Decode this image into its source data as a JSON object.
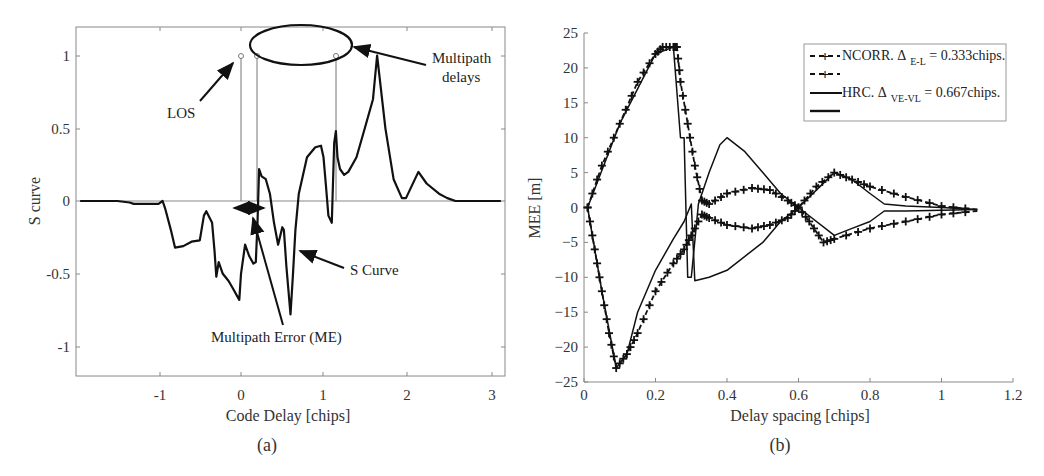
{
  "figure": {
    "panels": [
      {
        "id": "a",
        "caption": "(a)"
      },
      {
        "id": "b",
        "caption": "(b)"
      }
    ]
  },
  "chart_data": [
    {
      "type": "line",
      "panel": "(a)",
      "title": "",
      "xlabel": "Code Delay [chips]",
      "ylabel": "S curve",
      "xlim": [
        -1.95,
        3.15
      ],
      "ylim": [
        -1.2,
        1.2
      ],
      "xticks": [
        "-1",
        "0",
        "1",
        "2",
        "3"
      ],
      "yticks": [
        "1",
        "0.5",
        "0",
        "-0.5",
        "-1"
      ],
      "grid": false,
      "annotations": [
        "LOS",
        "Multipath delays",
        "S Curve",
        "Multipath Error (ME)"
      ],
      "series": [
        {
          "name": "S Curve",
          "x": [
            -1.95,
            -1.5,
            -1.35,
            -1.3,
            -1.0,
            -0.95,
            -0.92,
            -0.85,
            -0.8,
            -0.7,
            -0.6,
            -0.5,
            -0.45,
            -0.42,
            -0.35,
            -0.32,
            -0.3,
            -0.27,
            -0.22,
            -0.15,
            -0.1,
            -0.05,
            -0.02,
            0.0,
            0.05,
            0.1,
            0.15,
            0.18,
            0.2,
            0.22,
            0.25,
            0.3,
            0.35,
            0.4,
            0.45,
            0.5,
            0.52,
            0.55,
            0.6,
            0.63,
            0.66,
            0.7,
            0.8,
            0.9,
            0.97,
            1.0,
            1.03,
            1.06,
            1.1,
            1.13,
            1.15,
            1.17,
            1.2,
            1.25,
            1.3,
            1.4,
            1.5,
            1.6,
            1.65,
            1.68,
            1.75,
            1.85,
            1.95,
            2.0,
            2.05,
            2.15,
            2.25,
            2.4,
            2.5,
            2.6,
            2.7,
            3.15
          ],
          "y": [
            0,
            0,
            -0.01,
            -0.02,
            -0.02,
            0,
            -0.05,
            -0.2,
            -0.32,
            -0.31,
            -0.28,
            -0.27,
            -0.1,
            -0.07,
            -0.15,
            -0.35,
            -0.52,
            -0.42,
            -0.5,
            -0.55,
            -0.6,
            -0.65,
            -0.68,
            -0.5,
            -0.3,
            -0.38,
            -0.43,
            -0.42,
            -0.15,
            0.22,
            0.17,
            0.15,
            0.05,
            -0.15,
            -0.3,
            -0.18,
            -0.2,
            -0.45,
            -0.78,
            -0.5,
            -0.2,
            0.05,
            0.3,
            0.37,
            0.38,
            0.3,
            0.1,
            -0.1,
            -0.15,
            0.4,
            0.48,
            0.3,
            0.22,
            0.18,
            0.2,
            0.3,
            0.5,
            0.7,
            1.0,
            0.85,
            0.5,
            0.15,
            0.02,
            0.02,
            0.08,
            0.2,
            0.12,
            0.05,
            0.02,
            0,
            0,
            0
          ]
        },
        {
          "name": "LOS / Multipath delay stems",
          "x": [
            0.0,
            0.2,
            1.15
          ],
          "y": [
            1.0,
            1.0,
            1.0
          ]
        }
      ]
    },
    {
      "type": "line",
      "panel": "(b)",
      "title": "",
      "xlabel": "Delay spacing [chips]",
      "ylabel": "MEE [m]",
      "xlim": [
        0,
        1.2
      ],
      "ylim": [
        -25,
        25
      ],
      "xticks": [
        "0",
        "0.2",
        "0.4",
        "0.6",
        "0.8",
        "1",
        "1.2"
      ],
      "yticks": [
        "25",
        "20",
        "15",
        "10",
        "5",
        "0",
        "-5",
        "-10",
        "-15",
        "-20",
        "-25"
      ],
      "grid": false,
      "legend_position": "upper right",
      "legend": [
        {
          "style": "dashed-plus",
          "label": "NCORR. Δ",
          "subscript": "E-L",
          "suffix": " = 0.333chips."
        },
        {
          "style": "dashed-plus",
          "label": "",
          "subscript": "",
          "suffix": ""
        },
        {
          "style": "solid",
          "label": "HRC. Δ",
          "subscript": "VE-VL",
          "suffix": " = 0.667chips."
        },
        {
          "style": "solid",
          "label": "",
          "subscript": "",
          "suffix": ""
        }
      ],
      "series": [
        {
          "name": "NCORR upper envelope",
          "x": [
            0.01,
            0.05,
            0.1,
            0.15,
            0.2,
            0.22,
            0.25,
            0.26,
            0.27,
            0.29,
            0.31,
            0.33,
            0.35,
            0.4,
            0.47,
            0.52,
            0.57,
            0.6,
            0.65,
            0.7,
            0.75,
            0.8,
            0.9,
            1.0,
            1.1
          ],
          "y": [
            0,
            6,
            12,
            18,
            22,
            23,
            23,
            23,
            18,
            12,
            6,
            1,
            0.5,
            2,
            2.8,
            2.5,
            1,
            0,
            3,
            5,
            4,
            3,
            1.5,
            0.2,
            -0.3
          ]
        },
        {
          "name": "NCORR lower envelope",
          "x": [
            0.01,
            0.03,
            0.05,
            0.07,
            0.09,
            0.12,
            0.15,
            0.2,
            0.25,
            0.28,
            0.3,
            0.33,
            0.35,
            0.4,
            0.47,
            0.52,
            0.57,
            0.6,
            0.63,
            0.67,
            0.7,
            0.8,
            0.9,
            1.0,
            1.1
          ],
          "y": [
            0,
            -6,
            -12,
            -18,
            -23,
            -21,
            -18,
            -12,
            -8,
            -6,
            -4,
            -1,
            -1.5,
            -2.5,
            -3,
            -2.5,
            -1.5,
            0,
            -2,
            -5,
            -4.5,
            -3,
            -2,
            -1,
            -0.5
          ]
        },
        {
          "name": "HRC upper",
          "x": [
            0.01,
            0.1,
            0.2,
            0.25,
            0.27,
            0.28,
            0.29,
            0.3,
            0.32,
            0.35,
            0.38,
            0.4,
            0.45,
            0.5,
            0.55,
            0.6,
            0.7,
            0.75,
            0.8,
            0.84,
            0.9,
            1.0,
            1.1
          ],
          "y": [
            0,
            12,
            22,
            23,
            10,
            10,
            -10,
            -10,
            0.5,
            5,
            9,
            10,
            8,
            5,
            2,
            0,
            5,
            4,
            2,
            0.5,
            0.2,
            0,
            -0.3
          ]
        },
        {
          "name": "HRC lower",
          "x": [
            0.01,
            0.05,
            0.09,
            0.12,
            0.15,
            0.2,
            0.25,
            0.28,
            0.3,
            0.31,
            0.35,
            0.4,
            0.5,
            0.55,
            0.6,
            0.7,
            0.75,
            0.8,
            0.84,
            0.9,
            1.0,
            1.1
          ],
          "y": [
            0,
            -12,
            -23,
            -21,
            -15,
            -9,
            -4.5,
            -2,
            0.5,
            -10.5,
            -10,
            -9,
            -5,
            -2,
            0,
            -4,
            -3,
            -2,
            -0.5,
            -0.5,
            -0.4,
            -0.3
          ]
        }
      ]
    }
  ]
}
